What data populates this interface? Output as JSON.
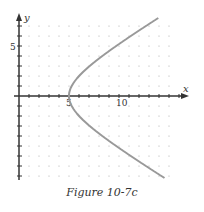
{
  "chart_data": {
    "type": "line",
    "title": "",
    "caption": "Figure 10-7c",
    "xlabel": "x",
    "ylabel": "y",
    "x_tick_labels": [
      "5",
      "10"
    ],
    "y_tick_labels": [
      "5"
    ],
    "xlim": [
      0,
      16
    ],
    "ylim": [
      -8.5,
      7.5
    ],
    "grid": "dotted",
    "legend": "none",
    "series": [
      {
        "name": "hyperbola right branch",
        "equation": "x^2/25 - y^2/9 = 1",
        "color": "#999999",
        "points": [
          [
            14.2,
            7.8
          ],
          [
            12.0,
            6.5
          ],
          [
            10.0,
            5.2
          ],
          [
            8.0,
            3.75
          ],
          [
            7.0,
            2.9
          ],
          [
            6.0,
            2.0
          ],
          [
            5.4,
            1.2
          ],
          [
            5.0,
            0
          ],
          [
            5.4,
            -1.2
          ],
          [
            6.0,
            -2.0
          ],
          [
            7.0,
            -2.9
          ],
          [
            8.0,
            -3.75
          ],
          [
            10.0,
            -5.2
          ],
          [
            12.0,
            -6.5
          ],
          [
            14.0,
            -7.6
          ],
          [
            15.2,
            -8.2
          ]
        ]
      }
    ]
  },
  "labels": {
    "x_axis": "x",
    "y_axis": "y",
    "x5": "5",
    "x10": "10",
    "y5": "5",
    "caption": "Figure 10-7c"
  }
}
